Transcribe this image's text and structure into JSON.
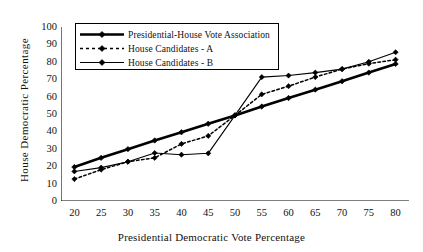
{
  "chart_data": {
    "type": "line",
    "title": "",
    "xlabel": "Presidential Democratic Vote Percentage",
    "ylabel": "House Democratic  Percentage",
    "x": [
      20,
      25,
      30,
      35,
      40,
      45,
      50,
      55,
      60,
      65,
      70,
      75,
      80
    ],
    "xlim": [
      17.5,
      82.5
    ],
    "ylim": [
      0,
      100
    ],
    "xticks": [
      "20",
      "25",
      "30",
      "35",
      "40",
      "45",
      "50",
      "55",
      "60",
      "65",
      "70",
      "75",
      "80"
    ],
    "yticks": [
      "0",
      "10",
      "20",
      "30",
      "40",
      "50",
      "60",
      "70",
      "80",
      "90",
      "100"
    ],
    "grid": false,
    "legend_position": "top-left",
    "series": [
      {
        "name": "Presidential-House Vote Association",
        "style": "solid-thick",
        "marker": "diamond",
        "values": [
          19.5,
          24.8,
          29.8,
          34.8,
          39.5,
          44.4,
          49.2,
          54.3,
          59.2,
          64.0,
          68.8,
          73.8,
          78.8
        ]
      },
      {
        "name": "House Candidates - A",
        "style": "dotted",
        "marker": "diamond",
        "values": [
          12.6,
          18.0,
          22.6,
          24.8,
          32.8,
          37.4,
          49.2,
          61.3,
          66.0,
          71.2,
          75.8,
          78.9,
          81.2
        ]
      },
      {
        "name": "House Candidates - B",
        "style": "solid-thin",
        "marker": "diamond",
        "values": [
          17.0,
          19.2,
          22.6,
          27.6,
          26.6,
          27.4,
          49.2,
          71.2,
          72.1,
          73.8,
          75.8,
          80.0,
          85.5
        ]
      }
    ]
  },
  "legend": {
    "items": [
      {
        "label": "Presidential-House Vote Association",
        "key": "solid-thick-diamond"
      },
      {
        "label": "House Candidates - A",
        "key": "dotted-diamond"
      },
      {
        "label": "House Candidates - B",
        "key": "solid-thin-diamond"
      }
    ]
  },
  "colors": {
    "ink": "#000000",
    "background": "#ffffff",
    "text": "#111111"
  }
}
